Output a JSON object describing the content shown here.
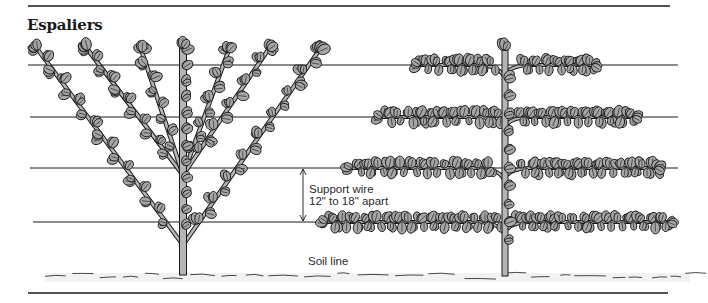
{
  "title": "Espaliers",
  "labels": {
    "support_wire_line1": "Support wire",
    "support_wire_line2": "12\" to 18\" apart",
    "soil_line": "Soil line"
  },
  "colors": {
    "ink": "#1a1a1a",
    "leaf_fill": "#a6a6a6",
    "trunk_fill": "#b5b5b5",
    "background": "#ffffff"
  },
  "rules": {
    "top": {
      "x1": 28,
      "x2": 670,
      "y": 6
    },
    "bottom": {
      "x1": 28,
      "x2": 668,
      "y": 293
    }
  },
  "wires": [
    {
      "y": 65,
      "x1": 28,
      "x2": 678
    },
    {
      "y": 117,
      "x1": 30,
      "x2": 678
    },
    {
      "y": 168,
      "x1": 30,
      "x2": 678
    },
    {
      "y": 222,
      "x1": 33,
      "x2": 678
    }
  ],
  "dimension_arrow": {
    "x": 303,
    "y1": 168,
    "y2": 222
  },
  "fan_tree": {
    "name": "Fan / V-shaped espalier",
    "trunk": {
      "x": 183,
      "y_top": 48,
      "y_bottom": 275
    },
    "branches": [
      {
        "from": [
          183,
          245
        ],
        "to": [
          38,
          50
        ]
      },
      {
        "from": [
          183,
          175
        ],
        "to": [
          88,
          50
        ]
      },
      {
        "from": [
          183,
          175
        ],
        "to": [
          142,
          52
        ]
      },
      {
        "from": [
          183,
          175
        ],
        "to": [
          228,
          52
        ]
      },
      {
        "from": [
          183,
          175
        ],
        "to": [
          268,
          50
        ]
      },
      {
        "from": [
          183,
          245
        ],
        "to": [
          318,
          52
        ]
      }
    ]
  },
  "tiered_tree": {
    "name": "Horizontal tiered espalier",
    "trunk": {
      "x": 505,
      "y_top": 50,
      "y_bottom": 276
    },
    "arms": [
      {
        "y": 65,
        "left": 420,
        "right": 592
      },
      {
        "y": 117,
        "left": 382,
        "right": 633
      },
      {
        "y": 168,
        "left": 352,
        "right": 655
      },
      {
        "y": 222,
        "left": 327,
        "right": 668
      }
    ]
  },
  "soil": {
    "y": 274,
    "x1": 45,
    "x2": 690
  }
}
